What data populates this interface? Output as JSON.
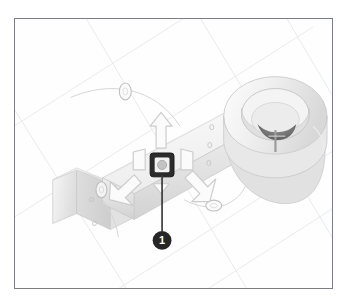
{
  "figure": {
    "frame_border_color": "#7b7f83",
    "background_color": "#fefefe",
    "grid_line_color": "#e3e4e6"
  },
  "model": {
    "name": "bracket-arm-assembly",
    "description": "Elongated arm bracket with cylindrical boss hub and mounting flange",
    "body_fill": "#f2f2f2",
    "body_shade_mid": "#e3e3e3",
    "body_shade_dark": "#d4d4d4",
    "body_outline": "#c9c9c9",
    "bore_dark": "#6d6d6d",
    "parts": [
      {
        "id": "cylindrical-boss",
        "label": "Cylindrical boss hub"
      },
      {
        "id": "arm-beam",
        "label": "Arm beam"
      },
      {
        "id": "mounting-flange",
        "label": "Mounting flange"
      }
    ]
  },
  "gizmo": {
    "name": "transform-manipulator",
    "center_handle": {
      "label": "Center drag handle",
      "square_color": "#2b2b2b",
      "inner_circle_color": "#b9b9b9"
    },
    "translate_arrows": [
      {
        "id": "arrow-up",
        "direction": "up",
        "label": "Translate up"
      },
      {
        "id": "arrow-down-left",
        "direction": "down-left",
        "label": "Translate down-left"
      },
      {
        "id": "arrow-down-right",
        "direction": "down-right",
        "label": "Translate down-right"
      }
    ],
    "rotate_handles": [
      {
        "id": "rotate-handle-top",
        "label": "Rotate handle top"
      },
      {
        "id": "rotate-handle-lower-right",
        "label": "Rotate handle lower right"
      },
      {
        "id": "rotate-handle-left",
        "label": "Rotate handle left"
      }
    ],
    "arrow_outline_color": "#cfcfcf"
  },
  "callout": {
    "number": "1",
    "badge_color": "#262626",
    "text_color": "#ffffff",
    "leader_color": "#3b3b3b",
    "leader_label": "Callout leader line"
  }
}
